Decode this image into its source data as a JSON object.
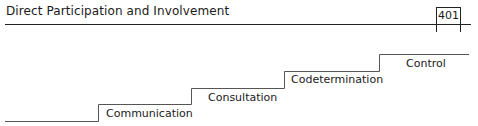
{
  "header": {
    "title": "Direct Participation and Involvement",
    "page_number": "401"
  },
  "figure": {
    "type": "staircase",
    "steps": [
      {
        "label": "Communication",
        "level": 1
      },
      {
        "label": "Consultation",
        "level": 2
      },
      {
        "label": "Codetermination",
        "level": 3
      },
      {
        "label": "Control",
        "level": 4
      }
    ],
    "line_color": "#555555"
  }
}
